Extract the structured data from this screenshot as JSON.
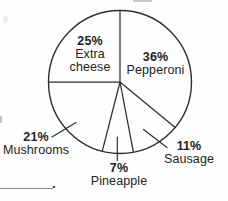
{
  "chart_data": {
    "type": "pie",
    "title": "",
    "unit": "percent",
    "categories": [
      "Pepperoni",
      "Sausage",
      "Pineapple",
      "Mushrooms",
      "Extra cheese"
    ],
    "values": [
      36,
      11,
      7,
      21,
      25
    ],
    "slices": [
      {
        "name": "Pepperoni",
        "pct_label": "36%",
        "value": 36
      },
      {
        "name": "Sausage",
        "pct_label": "11%",
        "value": 11
      },
      {
        "name": "Pineapple",
        "pct_label": "7%",
        "value": 7
      },
      {
        "name": "Mushrooms",
        "pct_label": "21%",
        "value": 21
      },
      {
        "name": "Extra cheese",
        "pct_label": "25%",
        "value": 25
      }
    ],
    "start_angle_deg": 0,
    "direction": "clockwise",
    "fill": "none",
    "outline_color": "#2e2e2e",
    "label_color": "#222222",
    "legend_position": "none",
    "label_style": "percent bold above category name; Pepperoni and Extra cheese inside pie, others outside with leader lines"
  },
  "footer": {
    "answer_blank_period": "."
  }
}
